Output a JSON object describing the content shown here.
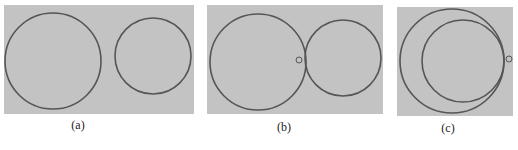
{
  "figure": {
    "background": "#ffffff",
    "panel_fill": "#c3c3c3",
    "stroke_color": "#555555",
    "panels": [
      {
        "id": "a",
        "caption": "(a)",
        "rect": {
          "x": 4,
          "y": 5,
          "w": 190,
          "h": 109
        },
        "caption_pos": {
          "x": 70,
          "y": 128
        },
        "description": "Two separate circles, not touching",
        "circles": [
          {
            "cx": 53,
            "cy": 61,
            "r": 48,
            "role": "large-circle"
          },
          {
            "cx": 153,
            "cy": 56,
            "r": 38,
            "role": "small-circle"
          }
        ],
        "markers": []
      },
      {
        "id": "b",
        "caption": "(b)",
        "rect": {
          "x": 207,
          "y": 5,
          "w": 176,
          "h": 109
        },
        "caption_pos": {
          "x": 276,
          "y": 130
        },
        "description": "Two circles externally tangent, with a small marker circle near the contact point",
        "circles": [
          {
            "cx": 258,
            "cy": 62,
            "r": 48,
            "role": "large-circle"
          },
          {
            "cx": 343,
            "cy": 58,
            "r": 38,
            "role": "small-circle"
          }
        ],
        "markers": [
          {
            "cx": 299,
            "cy": 60,
            "r": 3,
            "role": "contact-marker"
          }
        ]
      },
      {
        "id": "c",
        "caption": "(c)",
        "rect": {
          "x": 397,
          "y": 7,
          "w": 116,
          "h": 109
        },
        "caption_pos": {
          "x": 440,
          "y": 131
        },
        "description": "One circle internally tangent inside a larger circle, with a small marker circle at the tangent point",
        "circles": [
          {
            "cx": 452,
            "cy": 61,
            "r": 52,
            "role": "outer-circle"
          },
          {
            "cx": 463,
            "cy": 61,
            "r": 41,
            "role": "inner-circle"
          }
        ],
        "markers": [
          {
            "cx": 509,
            "cy": 59,
            "r": 3,
            "role": "contact-marker"
          }
        ]
      }
    ]
  }
}
